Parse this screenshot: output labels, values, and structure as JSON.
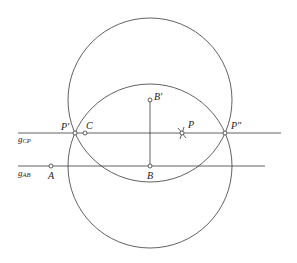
{
  "diagram": {
    "type": "geometric-construction",
    "colors": {
      "stroke": "#3a3a3a",
      "point_fill": "#ffffff",
      "text": "#222222",
      "background": "#ffffff"
    },
    "lines": [
      {
        "id": "g_CP",
        "label_main": "g",
        "label_sub": "CP",
        "y": 133,
        "x1": 18,
        "x2": 281
      },
      {
        "id": "g_AB",
        "label_main": "g",
        "label_sub": "AB",
        "y": 166,
        "x1": 18,
        "x2": 265
      }
    ],
    "circles": [
      {
        "id": "circle-B-prime",
        "center": "B'",
        "cx": 150,
        "cy": 100,
        "r": 82
      },
      {
        "id": "circle-B",
        "center": "B",
        "cx": 150,
        "cy": 166,
        "r": 82
      }
    ],
    "segments": [
      {
        "id": "segment-B-Bprime",
        "from": "B'",
        "to": "B"
      }
    ],
    "points": [
      {
        "name": "A",
        "label": "A",
        "x": 51,
        "y": 166
      },
      {
        "name": "B",
        "label": "B",
        "x": 150,
        "y": 166
      },
      {
        "name": "B'",
        "label": "B′",
        "x": 150,
        "y": 100
      },
      {
        "name": "C",
        "label": "C",
        "x": 85,
        "y": 133
      },
      {
        "name": "P",
        "label": "P",
        "x": 182,
        "y": 133
      },
      {
        "name": "P'",
        "label": "P′",
        "x": 75,
        "y": 133
      },
      {
        "name": "P''",
        "label": "P″",
        "x": 225,
        "y": 133
      }
    ]
  },
  "labels": {
    "g_cp_main": "g",
    "g_cp_sub": "CP",
    "g_ab_main": "g",
    "g_ab_sub": "AB",
    "A": "A",
    "B": "B",
    "B_prime": "B′",
    "C": "C",
    "P": "P",
    "P_prime": "P′",
    "P_double_prime": "P″"
  }
}
